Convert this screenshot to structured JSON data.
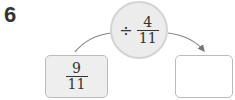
{
  "problem_number": "6",
  "operation": {
    "operator": "÷",
    "numerator": "4",
    "denominator": "11"
  },
  "input_box": {
    "numerator": "9",
    "denominator": "11"
  },
  "output_box": {
    "value": ""
  }
}
